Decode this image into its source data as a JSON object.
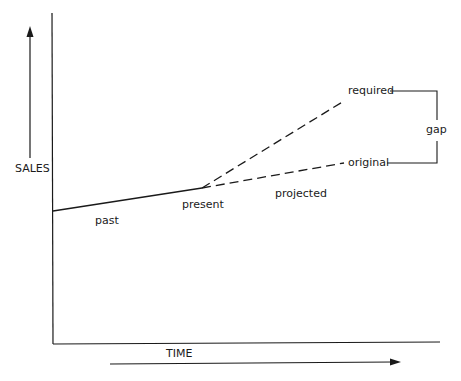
{
  "diagram": {
    "type": "line-diagram",
    "title": "",
    "axes": {
      "y_label": "SALES",
      "x_label": "TIME"
    },
    "segments": [
      {
        "name": "past",
        "style": "solid",
        "from": "start",
        "to": "present"
      },
      {
        "name": "required",
        "style": "dashed",
        "from": "present",
        "to": "required"
      },
      {
        "name": "original",
        "style": "dashed",
        "from": "present",
        "to": "original"
      }
    ],
    "labels": {
      "past": "past",
      "present": "present",
      "projected": "projected",
      "required": "required",
      "original": "original",
      "gap": "gap"
    },
    "colors": {
      "line": "#1a1a1a",
      "background": "#ffffff"
    }
  }
}
